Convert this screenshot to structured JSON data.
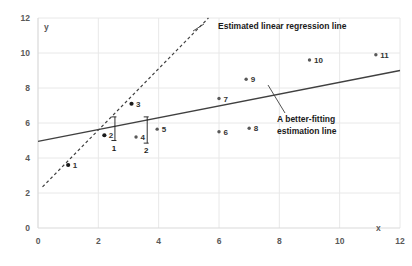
{
  "chart_data": {
    "type": "scatter",
    "title": "",
    "xlabel": "x",
    "ylabel": "y",
    "xlim": [
      0,
      12
    ],
    "ylim": [
      0,
      12
    ],
    "xticks": [
      0,
      2,
      4,
      6,
      8,
      10,
      12
    ],
    "yticks": [
      0,
      2,
      4,
      6,
      8,
      10,
      12
    ],
    "grid": true,
    "legend": "none",
    "points": [
      {
        "label": "1",
        "x": 1.0,
        "y": 3.6,
        "style": "filled"
      },
      {
        "label": "2",
        "x": 2.2,
        "y": 5.3,
        "style": "filled"
      },
      {
        "label": "3",
        "x": 3.1,
        "y": 7.1,
        "style": "filled"
      },
      {
        "label": "4",
        "x": 3.25,
        "y": 5.2,
        "style": "open"
      },
      {
        "label": "5",
        "x": 3.95,
        "y": 5.65,
        "style": "open"
      },
      {
        "label": "6",
        "x": 6.0,
        "y": 5.5,
        "style": "open"
      },
      {
        "label": "7",
        "x": 6.0,
        "y": 7.4,
        "style": "open"
      },
      {
        "label": "8",
        "x": 7.0,
        "y": 5.7,
        "style": "open"
      },
      {
        "label": "9",
        "x": 6.9,
        "y": 8.5,
        "style": "open"
      },
      {
        "label": "10",
        "x": 9.0,
        "y": 9.6,
        "style": "open"
      },
      {
        "label": "11",
        "x": 11.2,
        "y": 9.9,
        "style": "open"
      }
    ],
    "lines": [
      {
        "name": "estimated-linear-regression-line",
        "label": "Estimated linear regression line",
        "style": "dashed",
        "x0": 0.15,
        "y0": 2.35,
        "x1": 5.65,
        "y1": 12.0
      },
      {
        "name": "better-fitting-estimation-line",
        "label": "A better-fitting estimation line",
        "style": "solid",
        "x0": 0.0,
        "y0": 4.95,
        "x1": 12.0,
        "y1": 9.0
      }
    ],
    "residuals": [
      {
        "label": "1",
        "x": 2.55,
        "y_top": 6.35,
        "y_bottom": 5.0
      },
      {
        "label": "2",
        "x": 3.62,
        "y_top": 6.35,
        "y_bottom": 4.85
      }
    ],
    "annotations": [
      {
        "name": "dashed-line-callout",
        "text": "Estimated linear regression line"
      },
      {
        "name": "solid-line-callout-1",
        "text": "A better-fitting"
      },
      {
        "name": "solid-line-callout-2",
        "text": "estimation line"
      }
    ],
    "colors": {
      "axis": "#d9d9d9",
      "grid": "#e8e8e8",
      "tick_text": "#595959",
      "line": "#404040",
      "point": "#595959",
      "point_dark": "#1a1a1a",
      "annotation_text": "#1a1a1a",
      "background": "#ffffff"
    }
  }
}
